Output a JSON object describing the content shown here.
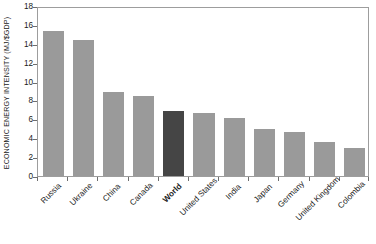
{
  "chart_data": {
    "type": "bar",
    "title": "",
    "subtitle": "",
    "xlabel": "",
    "ylabel": "ECONOMIC ENERGY INTENSITY (MJ/$GDP)",
    "categories": [
      "Russia",
      "Ukraine",
      "China",
      "Canada",
      "World",
      "United States",
      "India",
      "Japan",
      "Germany",
      "United Kingdom",
      "Colombia"
    ],
    "values": [
      15.4,
      14.4,
      8.9,
      8.5,
      6.9,
      6.7,
      6.1,
      4.95,
      4.7,
      3.6,
      3.0
    ],
    "highlight_category": "World",
    "ylim": [
      0,
      18
    ],
    "yticks": [
      0,
      2,
      4,
      6,
      8,
      10,
      12,
      14,
      16,
      18
    ],
    "ytick_labels": [
      "0",
      "2",
      "4",
      "6",
      "8",
      "10",
      "12",
      "14",
      "16",
      "18"
    ],
    "grid": false,
    "legend": null,
    "legend_position": "none",
    "colors": {
      "bar": "#9a9a9a",
      "bar_highlight": "#454545",
      "axis": "#9d9d9d",
      "tick": "#6e6e6e",
      "text": "#1a1a1a",
      "background": "#ffffff"
    }
  }
}
